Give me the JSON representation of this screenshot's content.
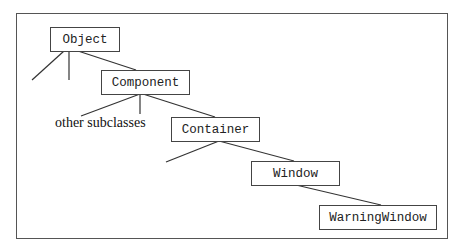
{
  "diagram": {
    "nodes": [
      {
        "id": "object",
        "label": "Object"
      },
      {
        "id": "component",
        "label": "Component"
      },
      {
        "id": "container",
        "label": "Container"
      },
      {
        "id": "window",
        "label": "Window"
      },
      {
        "id": "warningwindow",
        "label": "WarningWindow"
      }
    ],
    "annotations": {
      "other_subclasses": "other subclasses"
    },
    "edges": [
      {
        "from": "object",
        "to": "component"
      },
      {
        "from": "component",
        "to": "container"
      },
      {
        "from": "container",
        "to": "window"
      },
      {
        "from": "window",
        "to": "warningwindow"
      }
    ]
  }
}
